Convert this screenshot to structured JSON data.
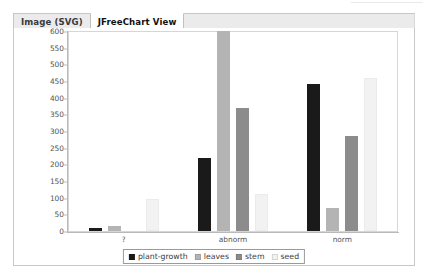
{
  "window": {
    "tabs": [
      {
        "label": "Image (SVG)",
        "active": false,
        "name": "tab-image-svg"
      },
      {
        "label": "JFreeChart View",
        "active": true,
        "name": "tab-jfreechart-view"
      }
    ]
  },
  "chart_data": {
    "type": "bar",
    "title": "",
    "subtitle": "",
    "xlabel": "",
    "ylabel": "",
    "categories": [
      "?",
      "abnorm",
      "norm"
    ],
    "series": [
      {
        "name": "plant-growth",
        "color": "#1a1a1a",
        "values": [
          10,
          220,
          440
        ]
      },
      {
        "name": "leaves",
        "color": "#b4b4b4",
        "values": [
          15,
          600,
          70
        ]
      },
      {
        "name": "stem",
        "color": "#8c8c8c",
        "values": [
          0,
          370,
          285
        ]
      },
      {
        "name": "seed",
        "color": "#f2f2f2",
        "values": [
          95,
          110,
          460
        ]
      }
    ],
    "ylim": [
      0,
      600
    ],
    "ytick_step": 50,
    "yticks": [
      0,
      50,
      100,
      150,
      200,
      250,
      300,
      350,
      400,
      450,
      500,
      550,
      600
    ],
    "grid": false,
    "legend_position": "bottom",
    "legend": [
      "plant-growth",
      "leaves",
      "stem",
      "seed"
    ]
  }
}
